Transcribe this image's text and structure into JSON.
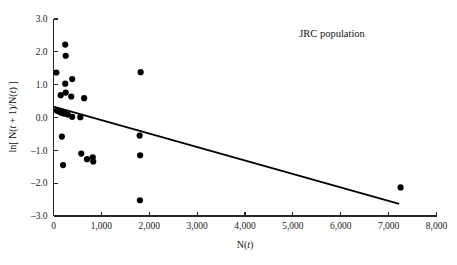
{
  "chart_data": {
    "type": "scatter",
    "title": "JRC population",
    "xlabel": "N(t)",
    "ylabel": "ln[ N(t + 1)/N(t) ]",
    "xlabel_parts": {
      "pre": "N(",
      "italic": "t",
      "post": ")"
    },
    "ylabel_parts": {
      "pre": "ln[ N(",
      "italic1": "t",
      "mid": " + 1)/N(",
      "italic2": "t",
      "post": ") ]"
    },
    "grid": false,
    "legend": "none",
    "xlim": [
      0,
      8000
    ],
    "ylim": [
      -3.0,
      3.0
    ],
    "xticks": [
      0,
      1000,
      2000,
      3000,
      4000,
      5000,
      6000,
      7000,
      8000
    ],
    "xtick_labels": [
      "0",
      "1,000",
      "2,000",
      "3,000",
      "4,000",
      "5,000",
      "6,000",
      "7,000",
      "8,000"
    ],
    "yticks": [
      -3.0,
      -2.0,
      -1.0,
      0.0,
      1.0,
      2.0,
      3.0
    ],
    "ytick_labels": [
      "-3.0",
      "-2.0",
      "-1.0",
      "0.0",
      "1.0",
      "2.0",
      "3.0"
    ],
    "marker": {
      "shape": "circle",
      "color": "#000000",
      "size_px": 3.1
    },
    "points": [
      {
        "x": 60,
        "y": 1.37
      },
      {
        "x": 150,
        "y": 0.68
      },
      {
        "x": 245,
        "y": 2.22
      },
      {
        "x": 255,
        "y": 1.88
      },
      {
        "x": 245,
        "y": 1.03
      },
      {
        "x": 255,
        "y": 0.76
      },
      {
        "x": 390,
        "y": 1.17
      },
      {
        "x": 370,
        "y": 0.64
      },
      {
        "x": 640,
        "y": 0.59
      },
      {
        "x": 1820,
        "y": 1.38
      },
      {
        "x": 70,
        "y": 0.21
      },
      {
        "x": 110,
        "y": 0.19
      },
      {
        "x": 150,
        "y": 0.15
      },
      {
        "x": 180,
        "y": 0.17
      },
      {
        "x": 205,
        "y": 0.13
      },
      {
        "x": 230,
        "y": 0.12
      },
      {
        "x": 300,
        "y": 0.09
      },
      {
        "x": 390,
        "y": 0.02
      },
      {
        "x": 560,
        "y": 0.01
      },
      {
        "x": 175,
        "y": -0.58
      },
      {
        "x": 1800,
        "y": -0.55
      },
      {
        "x": 580,
        "y": -1.1
      },
      {
        "x": 1810,
        "y": -1.15
      },
      {
        "x": 700,
        "y": -1.27
      },
      {
        "x": 820,
        "y": -1.21
      },
      {
        "x": 830,
        "y": -1.34
      },
      {
        "x": 200,
        "y": -1.45
      },
      {
        "x": 7250,
        "y": -2.13
      },
      {
        "x": 1805,
        "y": -2.52
      }
    ],
    "fit_line": {
      "kind": "linear-regression",
      "x_start": 0,
      "y_start": 0.33,
      "x_end": 7220,
      "y_end": -2.63,
      "color": "#000000"
    }
  }
}
